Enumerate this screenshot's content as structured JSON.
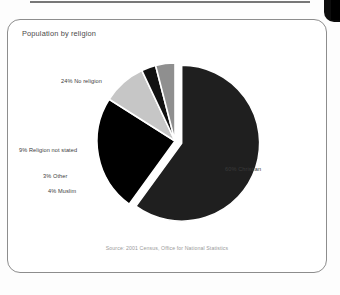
{
  "document": {
    "type": "scanned-figure"
  },
  "card": {
    "title": "Population by religion",
    "source_note": "Source: 2001 Census, Office for National Statistics"
  },
  "labels": {
    "no_religion": "24% No religion",
    "religion_not_stated": "9% Religion not stated",
    "other": "3% Other",
    "muslim": "4% Muslim",
    "christian": "60% Christian"
  },
  "colors": {
    "christian": "#1f1f1f",
    "no_religion": "#000000",
    "religion_not_stated": "#c6c6c6",
    "other": "#111111",
    "muslim": "#8f8f8f",
    "slice_gap": "#ffffff",
    "card_border": "#8d8d8d",
    "title_text": "#4a4a4a",
    "label_text": "#3b3b3b",
    "source_text": "#9a9a9a"
  },
  "chart_data": {
    "type": "pie",
    "title": "Population by religion",
    "subtitle": "",
    "xlabel": "",
    "ylabel": "",
    "legend_position": "none",
    "labels_position": "outside-with-leader-free",
    "exploded": true,
    "units": "percent",
    "total": 100,
    "categories": [
      "Christian",
      "No religion",
      "Religion not stated",
      "Muslim",
      "Other"
    ],
    "values": [
      60,
      24,
      9,
      4,
      3
    ],
    "slices": [
      {
        "name": "Christian",
        "value": 60,
        "label": "60% Christian",
        "color": "#1f1f1f",
        "exploded": true
      },
      {
        "name": "No religion",
        "value": 24,
        "label": "24% No religion",
        "color": "#000000",
        "exploded": false
      },
      {
        "name": "Religion not stated",
        "value": 9,
        "label": "9% Religion not stated",
        "color": "#c6c6c6",
        "exploded": false
      },
      {
        "name": "Other",
        "value": 3,
        "label": "3% Other",
        "color": "#111111",
        "exploded": false
      },
      {
        "name": "Muslim",
        "value": 4,
        "label": "4% Muslim",
        "color": "#8f8f8f",
        "exploded": false
      }
    ],
    "annotations": [
      "Source: 2001 Census, Office for National Statistics"
    ]
  }
}
